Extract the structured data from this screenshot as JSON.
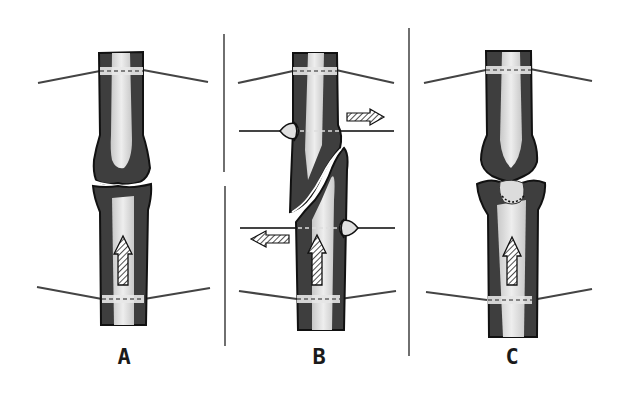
{
  "figure": {
    "type": "orthopedic-diagram",
    "panels": [
      {
        "id": "A",
        "label": "A",
        "description": "Two bone segments aligned end-to-end with joint surfaces in contact, two transverse wires (top and bottom), axial compression arrow pointing up in lower segment"
      },
      {
        "id": "B",
        "label": "B",
        "description": "Oblique fracture with two olive (stopper) wires applying opposing transverse forces, plus two plain transverse wires; horizontal arrows indicate opposing push directions, axial arrow pointing up"
      },
      {
        "id": "C",
        "label": "C",
        "description": "Joint with convex head seated into a concave socket segment (dotted outline), two transverse wires, axial compression arrow pointing up"
      }
    ],
    "colors": {
      "bone_cortex": "#3c3c3c",
      "bone_medulla": "#d8d8d8",
      "outline": "#111111",
      "wire": "#555555",
      "background": "#ffffff"
    }
  }
}
